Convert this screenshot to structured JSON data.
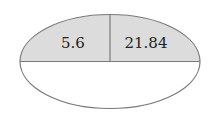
{
  "diagram": {
    "type": "divided-ellipse",
    "cells": [
      {
        "id": "top-left",
        "value": "5.6",
        "shaded": true
      },
      {
        "id": "top-right",
        "value": "21.84",
        "shaded": true
      },
      {
        "id": "bottom",
        "value": "",
        "shaded": false
      }
    ],
    "colors": {
      "shade": "#dcdcdc",
      "stroke": "#7a7a7a",
      "background": "#ffffff"
    }
  }
}
